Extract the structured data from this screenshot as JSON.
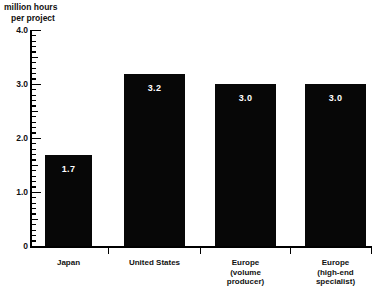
{
  "chart_data": {
    "type": "bar",
    "title": "",
    "subtitle": "",
    "ylabel_line1": "million hours",
    "ylabel_line2": "per project",
    "xlabel": "",
    "ylim": [
      0,
      4.0
    ],
    "ytick_labels": [
      "4.0",
      "3.0",
      "2.0",
      "1.0",
      "0"
    ],
    "ytick_values": [
      4.0,
      3.0,
      2.0,
      1.0,
      0
    ],
    "minor_tick_interval": 0.1,
    "half_tick_interval": 0.5,
    "grid": false,
    "legend": null,
    "bar_color": "#070707",
    "value_label_color": "#ffffff",
    "axis_color": "#000000",
    "categories": [
      "Japan",
      "United States",
      "Europe (volume producer)",
      "Europe (high-end specialist)"
    ],
    "category_label_lines": [
      [
        "Japan"
      ],
      [
        "United States"
      ],
      [
        "Europe",
        "(volume",
        "producer)"
      ],
      [
        "Europe",
        "(high-end",
        "specialist)"
      ]
    ],
    "values": [
      1.7,
      3.2,
      3.0,
      3.0
    ],
    "value_labels": [
      "1.7",
      "3.2",
      "3.0",
      "3.0"
    ]
  }
}
